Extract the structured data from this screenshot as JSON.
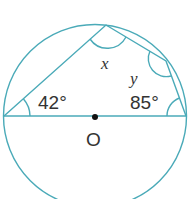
{
  "diagram": {
    "type": "circle-geometry",
    "stroke_color": "#4aaab8",
    "center_label": "O",
    "angles": {
      "left": "42°",
      "right": "85°",
      "top_unknown": "x",
      "right_unknown": "y"
    },
    "points": {
      "A": [
        4,
        116
      ],
      "B": [
        106,
        25
      ],
      "C": [
        166,
        61
      ],
      "D": [
        186,
        116
      ],
      "O": [
        95,
        116
      ]
    }
  }
}
